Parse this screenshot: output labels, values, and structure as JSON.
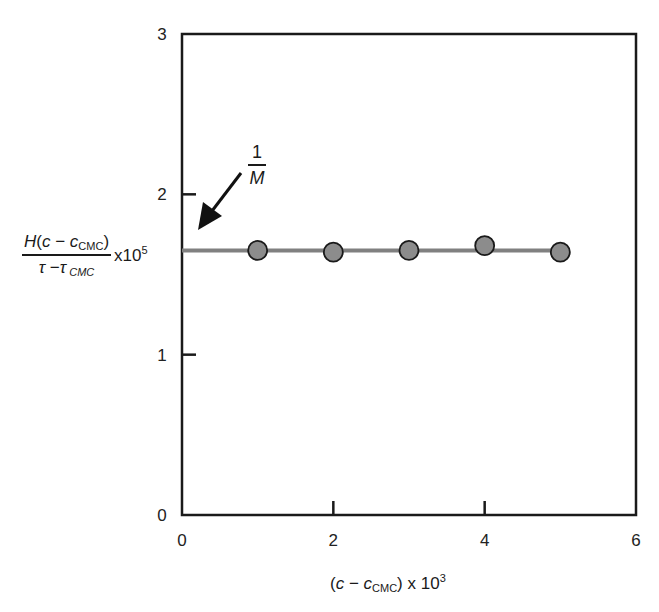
{
  "chart_data": {
    "type": "scatter",
    "title": "",
    "xlabel": "(c − c_CMC) x 10^3",
    "ylabel": "H(c − c_CMC) / (τ − τ_CMC) x10^5",
    "xlim": [
      0,
      6
    ],
    "ylim": [
      0,
      3
    ],
    "x_ticks": [
      0,
      2,
      4,
      6
    ],
    "y_ticks": [
      0,
      1,
      2,
      3
    ],
    "x_tick_labels": [
      "0",
      "2",
      "4",
      "6"
    ],
    "y_tick_labels": [
      "0",
      "1",
      "2",
      "3"
    ],
    "grid": false,
    "legend": null,
    "series": [
      {
        "name": "data points",
        "marker": "circle",
        "color": "#8c8c8c",
        "edgecolor": "#1a1a1a",
        "x": [
          1,
          2,
          3,
          4,
          5
        ],
        "y": [
          1.65,
          1.64,
          1.65,
          1.68,
          1.64
        ]
      },
      {
        "name": "fit line",
        "type": "hline",
        "color": "#808080",
        "y": 1.65,
        "x_range": [
          0,
          5
        ]
      }
    ],
    "annotations": [
      {
        "text": "1/M",
        "arrow_to": {
          "x": 0.2,
          "y": 1.72
        },
        "description": "intercept equals 1/M"
      }
    ]
  },
  "labels": {
    "y_num_H": "H",
    "y_num_open": "(",
    "y_num_c": "c",
    "y_num_minus": " − ",
    "y_num_c2": "c",
    "y_num_sub": "CMC",
    "y_num_close": ")",
    "y_den_tau": "τ",
    "y_den_minus": " −",
    "y_den_tau2": "τ",
    "y_den_sub": " CMC",
    "y_mult": "x10",
    "y_exp": "5",
    "x_open": "(",
    "x_c": "c",
    "x_minus": " − ",
    "x_c2": "c",
    "x_sub": "CMC",
    "x_close": ") x 10",
    "x_exp": "3",
    "annot_num": "1",
    "annot_den": "M"
  },
  "colors": {
    "frame": "#1a1a1a",
    "line": "#808080",
    "marker_fill": "#8c8c8c",
    "marker_edge": "#1a1a1a"
  }
}
